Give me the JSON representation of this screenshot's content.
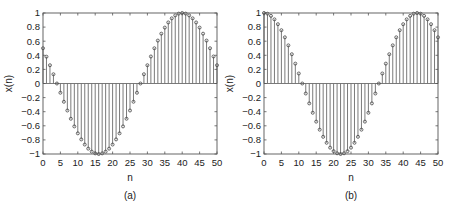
{
  "figure": {
    "panels": [
      {
        "caption": "(a)",
        "xlabel": "n",
        "ylabel": "x(n)"
      },
      {
        "caption": "(b)",
        "xlabel": "n",
        "ylabel": "x(n)"
      }
    ],
    "colors": {
      "stem": "#6b6b6b",
      "marker": "#444444",
      "axis": "#555555",
      "background": "#ffffff"
    }
  },
  "chart_data": [
    {
      "type": "stem",
      "title": "",
      "caption": "(a)",
      "xlabel": "n",
      "ylabel": "x(n)",
      "formula": "cos(pi*n/24 + pi/3)",
      "xlim": [
        0,
        50
      ],
      "ylim": [
        -1,
        1
      ],
      "xticks": [
        0,
        5,
        10,
        15,
        20,
        25,
        30,
        35,
        40,
        45,
        50
      ],
      "yticks": [
        -1,
        -0.8,
        -0.6,
        -0.4,
        -0.2,
        0,
        0.2,
        0.4,
        0.6,
        0.8,
        1
      ],
      "ytick_labels": [
        "-1",
        "-0.8",
        "-0.6",
        "-0.4",
        "-0.2",
        "0",
        "0.2",
        "0.4",
        "0.6",
        "0.8",
        "1"
      ],
      "x": [
        0,
        1,
        2,
        3,
        4,
        5,
        6,
        7,
        8,
        9,
        10,
        11,
        12,
        13,
        14,
        15,
        16,
        17,
        18,
        19,
        20,
        21,
        22,
        23,
        24,
        25,
        26,
        27,
        28,
        29,
        30,
        31,
        32,
        33,
        34,
        35,
        36,
        37,
        38,
        39,
        40,
        41,
        42,
        43,
        44,
        45,
        46,
        47,
        48,
        49,
        50
      ],
      "values": [
        0.5,
        0.38,
        0.259,
        0.131,
        0.0,
        -0.131,
        -0.259,
        -0.383,
        -0.5,
        -0.609,
        -0.707,
        -0.793,
        -0.866,
        -0.924,
        -0.966,
        -0.991,
        -1.0,
        -0.991,
        -0.966,
        -0.924,
        -0.866,
        -0.793,
        -0.707,
        -0.609,
        -0.5,
        -0.383,
        -0.259,
        -0.131,
        0.0,
        0.131,
        0.259,
        0.383,
        0.5,
        0.609,
        0.707,
        0.793,
        0.866,
        0.924,
        0.966,
        0.991,
        1.0,
        0.991,
        0.966,
        0.924,
        0.866,
        0.793,
        0.707,
        0.609,
        0.5,
        0.383,
        0.259
      ],
      "grid": false
    },
    {
      "type": "stem",
      "title": "",
      "caption": "(b)",
      "xlabel": "n",
      "ylabel": "x(n)",
      "formula": "cos(pi*n/22)",
      "xlim": [
        0,
        50
      ],
      "ylim": [
        -1,
        1
      ],
      "xticks": [
        0,
        5,
        10,
        15,
        20,
        25,
        30,
        35,
        40,
        45,
        50
      ],
      "yticks": [
        -1,
        -0.8,
        -0.6,
        -0.4,
        -0.2,
        0,
        0.2,
        0.4,
        0.6,
        0.8,
        1
      ],
      "ytick_labels": [
        "-1",
        "-0.8",
        "-0.6",
        "-0.4",
        "-0.2",
        "0",
        "0.2",
        "0.4",
        "0.6",
        "0.8",
        "1"
      ],
      "x": [
        0,
        1,
        2,
        3,
        4,
        5,
        6,
        7,
        8,
        9,
        10,
        11,
        12,
        13,
        14,
        15,
        16,
        17,
        18,
        19,
        20,
        21,
        22,
        23,
        24,
        25,
        26,
        27,
        28,
        29,
        30,
        31,
        32,
        33,
        34,
        35,
        36,
        37,
        38,
        39,
        40,
        41,
        42,
        43,
        44,
        45,
        46,
        47,
        48,
        49,
        50
      ],
      "values": [
        1.0,
        0.99,
        0.959,
        0.91,
        0.841,
        0.756,
        0.655,
        0.541,
        0.415,
        0.282,
        0.142,
        0.0,
        -0.142,
        -0.282,
        -0.415,
        -0.541,
        -0.655,
        -0.756,
        -0.841,
        -0.91,
        -0.959,
        -0.99,
        -1.0,
        -0.99,
        -0.959,
        -0.91,
        -0.841,
        -0.756,
        -0.655,
        -0.541,
        -0.415,
        -0.282,
        -0.142,
        0.0,
        0.142,
        0.282,
        0.415,
        0.541,
        0.655,
        0.756,
        0.841,
        0.91,
        0.959,
        0.99,
        1.0,
        0.99,
        0.959,
        0.91,
        0.841,
        0.756,
        0.655
      ],
      "grid": false
    }
  ]
}
